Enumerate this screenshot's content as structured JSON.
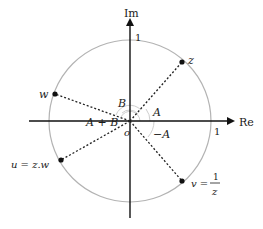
{
  "diagram": {
    "axes": {
      "real_label": "Re",
      "imag_label": "Im",
      "real_unit_label": "1",
      "imag_unit_label": "1",
      "origin_label": "o"
    },
    "unit_circle": {
      "radius": 1,
      "color": "#b3b3b3"
    },
    "points": [
      {
        "id": "z",
        "label": "z"
      },
      {
        "id": "w",
        "label": "w"
      },
      {
        "id": "u",
        "label": "u = z.w"
      },
      {
        "id": "v",
        "label_prefix": "v =",
        "label_num": "1",
        "label_den": "z"
      }
    ],
    "angles": [
      {
        "id": "A",
        "label": "A"
      },
      {
        "id": "B",
        "label": "B"
      },
      {
        "id": "A+B",
        "label": "A + B"
      },
      {
        "id": "-A",
        "label": "−A"
      }
    ],
    "colors": {
      "axis": "#111111",
      "circle": "#b3b3b3",
      "segment": "#222222",
      "arc": "#c8c8c8",
      "point": "#111111"
    }
  }
}
